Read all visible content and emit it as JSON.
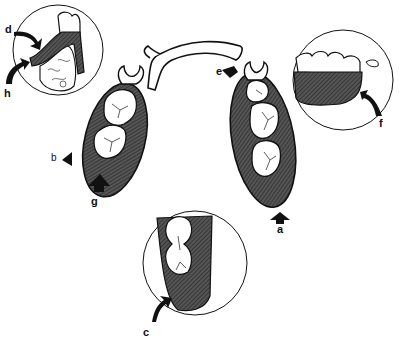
{
  "diagram": {
    "colors": {
      "ink": "#111111",
      "base_fill": "#4a4a4a",
      "tooth_fill": "#ffffff",
      "background": "#ffffff"
    },
    "labels": {
      "a": "a",
      "b": "b",
      "c": "c",
      "d": "d",
      "e": "e",
      "f": "f",
      "g": "g",
      "h": "h"
    },
    "components": {
      "left_saddle": "left denture base saddle with two molars",
      "right_saddle": "right denture base saddle with three teeth",
      "major_connector": "lingual bar connector",
      "inset_top_left": "cross-section of base over alveolar ridge",
      "inset_top_right": "lateral view of denture base and clasp",
      "inset_bottom": "distal extension of base"
    }
  }
}
